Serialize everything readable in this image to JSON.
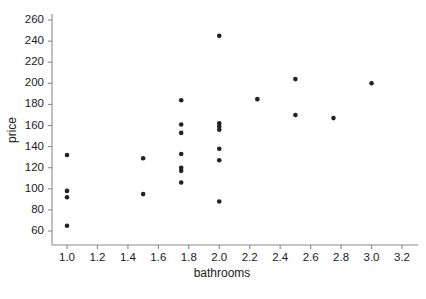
{
  "chart_data": {
    "type": "scatter",
    "title": "",
    "xlabel": "bathrooms",
    "ylabel": "price",
    "xlim": [
      0.88,
      3.3
    ],
    "ylim": [
      52,
      268
    ],
    "grid": false,
    "legend": null,
    "xticks": [
      "1.0",
      "1.2",
      "1.4",
      "1.6",
      "1.8",
      "2.0",
      "2.2",
      "2.4",
      "2.6",
      "2.8",
      "3.0",
      "3.2"
    ],
    "xtick_values": [
      1.0,
      1.2,
      1.4,
      1.6,
      1.8,
      2.0,
      2.2,
      2.4,
      2.6,
      2.8,
      3.0,
      3.2
    ],
    "yticks": [
      "60",
      "80",
      "100",
      "120",
      "140",
      "160",
      "180",
      "200",
      "220",
      "240",
      "260"
    ],
    "ytick_values": [
      60,
      80,
      100,
      120,
      140,
      160,
      180,
      200,
      220,
      240,
      260
    ],
    "marker": {
      "shape": "circle",
      "color": "#222222",
      "size": 2.3
    },
    "points": [
      {
        "x": 1.0,
        "y": 132
      },
      {
        "x": 1.0,
        "y": 98
      },
      {
        "x": 1.0,
        "y": 92
      },
      {
        "x": 1.0,
        "y": 65
      },
      {
        "x": 1.5,
        "y": 129
      },
      {
        "x": 1.5,
        "y": 95
      },
      {
        "x": 1.75,
        "y": 184
      },
      {
        "x": 1.75,
        "y": 161
      },
      {
        "x": 1.75,
        "y": 153
      },
      {
        "x": 1.75,
        "y": 133
      },
      {
        "x": 1.75,
        "y": 120
      },
      {
        "x": 1.75,
        "y": 117
      },
      {
        "x": 1.75,
        "y": 106
      },
      {
        "x": 2.0,
        "y": 245
      },
      {
        "x": 2.0,
        "y": 162
      },
      {
        "x": 2.0,
        "y": 159
      },
      {
        "x": 2.0,
        "y": 156
      },
      {
        "x": 2.0,
        "y": 138
      },
      {
        "x": 2.0,
        "y": 127
      },
      {
        "x": 2.0,
        "y": 88
      },
      {
        "x": 2.25,
        "y": 185
      },
      {
        "x": 2.5,
        "y": 204
      },
      {
        "x": 2.5,
        "y": 170
      },
      {
        "x": 2.75,
        "y": 167
      },
      {
        "x": 3.0,
        "y": 200
      }
    ]
  },
  "colors": {
    "axis": "#8a8a8a",
    "text": "#1a1a1a",
    "marker": "#222222",
    "background": "#ffffff"
  }
}
